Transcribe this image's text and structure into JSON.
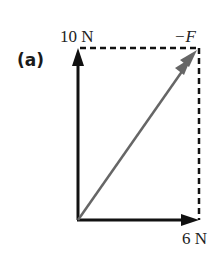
{
  "figure": {
    "panel_label": "(a)",
    "vertical_force_label": "10 N",
    "horizontal_force_label": "6 N",
    "resultant_label": "−F",
    "colors": {
      "force_arrows": "#111111",
      "resultant_arrow": "#666666",
      "dashed_lines": "#111111",
      "background": "#ffffff"
    },
    "vectors": [
      {
        "name": "vertical-force",
        "magnitude": "10 N",
        "direction": "up"
      },
      {
        "name": "horizontal-force",
        "magnitude": "6 N",
        "direction": "right"
      },
      {
        "name": "resultant",
        "label": "−F",
        "direction": "diagonal up-right"
      }
    ]
  }
}
